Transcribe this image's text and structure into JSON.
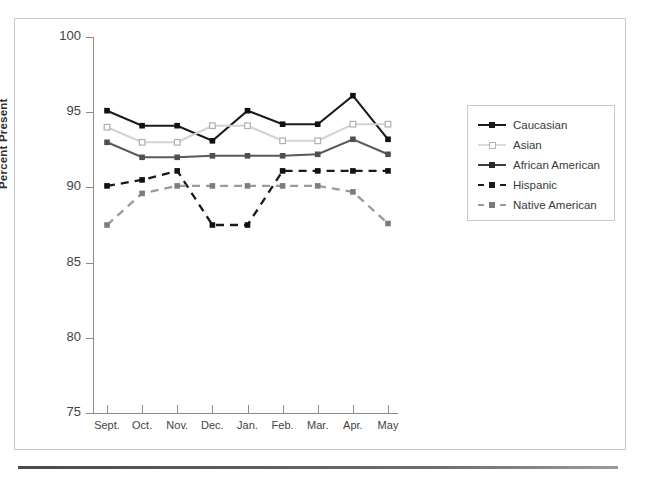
{
  "figure": {
    "has_frame": true,
    "bottom_rule": true
  },
  "chart_data": {
    "type": "line",
    "title": "",
    "xlabel": "",
    "ylabel": "Percent Present",
    "ylim": [
      75,
      100
    ],
    "yticks": [
      75,
      80,
      85,
      90,
      95,
      100
    ],
    "grid": false,
    "legend_position": "right",
    "categories": [
      "Sept.",
      "Oct.",
      "Nov.",
      "Dec.",
      "Jan.",
      "Feb.",
      "Mar.",
      "Apr.",
      "May"
    ],
    "series": [
      {
        "name": "Caucasian",
        "color": "#1a1a1a",
        "dash": "solid",
        "marker": "filled-square",
        "values": [
          95.1,
          94.1,
          94.1,
          93.1,
          95.1,
          94.2,
          94.2,
          96.1,
          93.2
        ]
      },
      {
        "name": "Asian",
        "color": "#d3d3d3",
        "dash": "solid",
        "marker": "open-square",
        "values": [
          94.0,
          93.0,
          93.0,
          94.1,
          94.1,
          93.1,
          93.1,
          94.2,
          94.2
        ]
      },
      {
        "name": "African American",
        "color": "#595959",
        "dash": "solid",
        "marker": "filled-square",
        "values": [
          93.0,
          92.0,
          92.0,
          92.1,
          92.1,
          92.1,
          92.2,
          93.2,
          92.2
        ]
      },
      {
        "name": "Hispanic",
        "color": "#1a1a1a",
        "dash": "dashed",
        "marker": "filled-square",
        "values": [
          90.1,
          90.5,
          91.1,
          87.5,
          87.5,
          91.1,
          91.1,
          91.1,
          91.1
        ]
      },
      {
        "name": "Native American",
        "color": "#9a9a9a",
        "dash": "dashed",
        "marker": "filled-square",
        "values": [
          87.5,
          89.6,
          90.1,
          90.1,
          90.1,
          90.1,
          90.1,
          89.7,
          87.6
        ]
      }
    ]
  },
  "axis": {
    "y_title": "Percent Present",
    "y_tick_labels": [
      "100",
      "95",
      "90",
      "85",
      "80",
      "75"
    ],
    "x_tick_labels": [
      "Sept.",
      "Oct.",
      "Nov.",
      "Dec.",
      "Jan.",
      "Feb.",
      "Mar.",
      "Apr.",
      "May"
    ]
  },
  "legend": {
    "items": [
      {
        "label": "Caucasian"
      },
      {
        "label": "Asian"
      },
      {
        "label": "African American"
      },
      {
        "label": "Hispanic"
      },
      {
        "label": "Native American"
      }
    ]
  }
}
